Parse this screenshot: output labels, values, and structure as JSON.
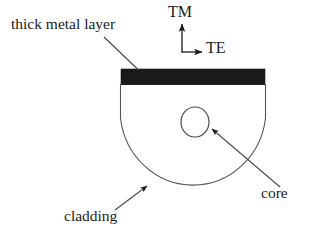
{
  "figure": {
    "background_color": "#ffffff",
    "ink_color": "#1b1b1b",
    "metal_fill_color": "#1a1a1a",
    "outline_color": "#4a4a4a"
  },
  "labels": {
    "thick_metal_layer": "thick metal layer",
    "tm": "TM",
    "te": "TE",
    "core": "core",
    "cladding": "cladding"
  },
  "geometry": {
    "metal_bar": {
      "x": 121,
      "y": 69,
      "width": 144,
      "height": 15
    },
    "cladding_shape": {
      "left": 120,
      "right": 266,
      "top": 84,
      "bottom": 191
    },
    "core_circle": {
      "cx": 195,
      "cy": 122,
      "rx": 14,
      "ry": 15
    },
    "axes_origin": {
      "x": 182,
      "y": 52
    },
    "tm_arrow_tip": {
      "x": 182,
      "y": 21
    },
    "te_arrow_tip": {
      "x": 205,
      "y": 52
    }
  },
  "annotations": {
    "thick_metal_layer_leader": {
      "from_x": 104,
      "from_y": 37,
      "to_x": 138,
      "to_y": 70
    },
    "core_leader": {
      "from_x": 279,
      "from_y": 186,
      "to_x": 210,
      "to_y": 128
    },
    "cladding_leader": {
      "from_x": 116,
      "from_y": 209,
      "to_x": 149,
      "to_y": 184
    }
  }
}
